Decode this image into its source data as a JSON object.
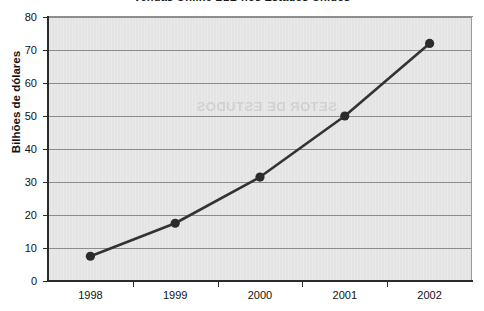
{
  "chart_data": {
    "type": "line",
    "title": "Vendas Online B2B nos Estados Unidos",
    "xlabel": "",
    "ylabel": "Bilhões de dólares",
    "categories": [
      "1998",
      "1999",
      "2000",
      "2001",
      "2002"
    ],
    "values": [
      7.5,
      17.5,
      31.5,
      50,
      72
    ],
    "series": [
      {
        "name": "Vendas Online B2B",
        "values": [
          7.5,
          17.5,
          31.5,
          50,
          72
        ]
      }
    ],
    "ylim": [
      0,
      80
    ],
    "ytick_labels": [
      "0",
      "10",
      "20",
      "30",
      "40",
      "50",
      "60",
      "70",
      "80"
    ],
    "ytick_values": [
      0,
      10,
      20,
      30,
      40,
      50,
      60,
      70,
      80
    ],
    "grid": true,
    "grid_axis": "y",
    "legend": "none",
    "marker": "circle",
    "colors": {
      "line": "#333333",
      "marker": "#2b2b2b",
      "plot_background": "#e4e4e4",
      "gridline": "#8c8c8c",
      "axis": "#2b2b2b",
      "text": "#111111",
      "figure_background": "#ffffff"
    }
  },
  "watermark": {
    "text": "SETOR DE ESTUDOS"
  }
}
